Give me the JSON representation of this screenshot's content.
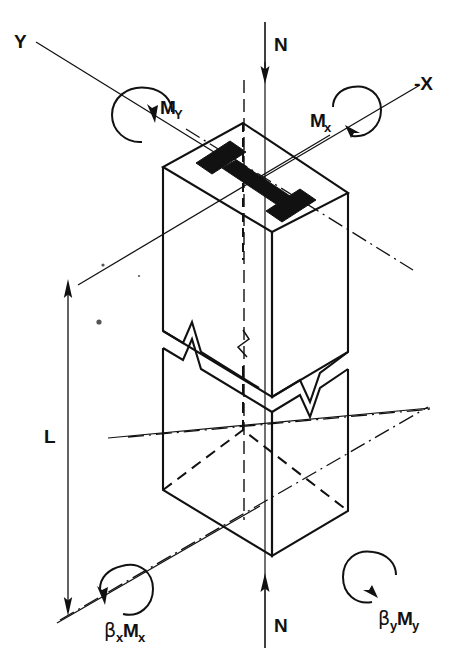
{
  "figure": {
    "domain_note": "isometric structural engineering diagram"
  },
  "axes": {
    "y_axis_label": "Y",
    "x_axis_label": "-X"
  },
  "loads": {
    "axial_top_label": "N",
    "axial_bottom_label": "N",
    "moment_y_top": "M",
    "moment_y_top_sub": "Y",
    "moment_x_top": "M",
    "moment_x_top_sub": "x",
    "moment_x_bottom_beta": "β",
    "moment_x_bottom_beta_sub": "x",
    "moment_x_bottom_m": "M",
    "moment_x_bottom_m_sub": "x",
    "moment_y_bottom_beta": "β",
    "moment_y_bottom_beta_sub": "y",
    "moment_y_bottom_m": "M",
    "moment_y_bottom_m_sub": "y"
  },
  "dimension": {
    "length_label": "L"
  },
  "member": {
    "section_shape": "i-beam-cross-section",
    "break_symbol": "zigzag-break-line"
  },
  "colors": {
    "ink": "#111111",
    "background": "#ffffff"
  }
}
